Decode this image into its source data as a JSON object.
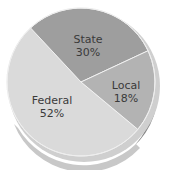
{
  "chart_data": {
    "type": "pie",
    "title": "",
    "style": "3d-tilted",
    "slices": [
      {
        "label": "State",
        "value": 30,
        "display": "30%",
        "color": "#9e9e9e"
      },
      {
        "label": "Local",
        "value": 18,
        "display": "18%",
        "color": "#b3b3b3"
      },
      {
        "label": "Federal",
        "value": 52,
        "display": "52%",
        "color": "#dadada"
      }
    ],
    "categories": [
      "State",
      "Local",
      "Federal"
    ],
    "values": [
      30,
      18,
      52
    ],
    "legend": "none (labels inside slices)"
  },
  "labels": {
    "state": {
      "name": "State",
      "pct": "30%"
    },
    "local": {
      "name": "Local",
      "pct": "18%"
    },
    "federal": {
      "name": "Federal",
      "pct": "52%"
    }
  }
}
